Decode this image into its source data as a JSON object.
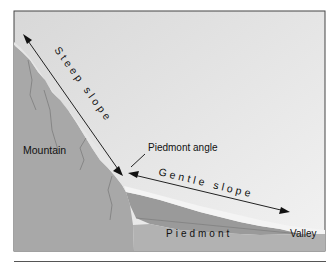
{
  "diagram": {
    "labels": {
      "steep_slope": "Steep slope",
      "gentle_slope": "Gentle slope",
      "piedmont_angle": "Piedmont angle",
      "mountain": "Mountain",
      "piedmont": "Piedmont",
      "valley": "Valley"
    },
    "colors": {
      "sky": "#e4e4e4",
      "mountain": "#a9a9a9",
      "piedmont_slope": "#9c9c9c",
      "piedmont_base": "#b0b0b0",
      "highlight": "#efefef",
      "line": "#222222"
    }
  }
}
